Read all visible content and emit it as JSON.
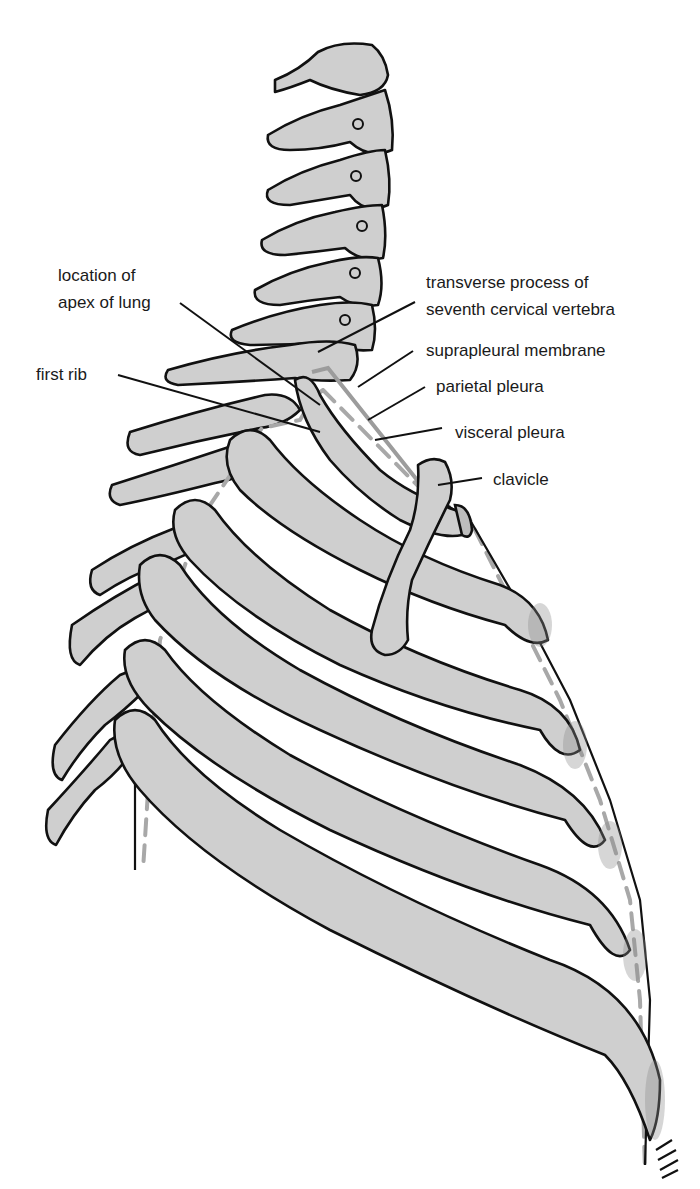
{
  "figure": {
    "colors": {
      "bone_fill": "#cfcfcf",
      "outline": "#111111",
      "pleura_line": "#a8a8a8",
      "background": "#ffffff"
    }
  },
  "labels": {
    "apex_line1": "location of",
    "apex_line2": "apex of lung",
    "first_rib": "first rib",
    "transverse_line1": "transverse process of",
    "transverse_line2": "seventh cervical vertebra",
    "suprapleural": "suprapleural membrane",
    "parietal": "parietal pleura",
    "visceral": "visceral pleura",
    "clavicle": "clavicle"
  }
}
